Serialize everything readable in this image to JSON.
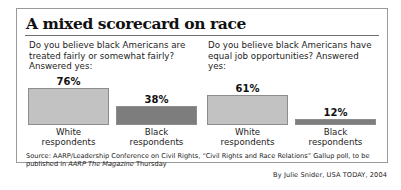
{
  "header": {
    "title": "A mixed scorecard on race"
  },
  "panels": [
    {
      "question": "Do you believe black Americans are treated fairly or somewhat fairly? Answered yes:",
      "bars": [
        {
          "value_label": "76%",
          "value": 76,
          "label_line1": "White",
          "label_line2": "respondents",
          "color": "#c2c2c2"
        },
        {
          "value_label": "38%",
          "value": 38,
          "label_line1": "Black",
          "label_line2": "respondents",
          "color": "#7d7d7d"
        }
      ]
    },
    {
      "question": "Do you believe black Americans have equal job opportunities? Answered yes:",
      "bars": [
        {
          "value_label": "61%",
          "value": 61,
          "label_line1": "White",
          "label_line2": "respondents",
          "color": "#c2c2c2"
        },
        {
          "value_label": "12%",
          "value": 12,
          "label_line1": "Black",
          "label_line2": "respondents",
          "color": "#7d7d7d"
        }
      ]
    }
  ],
  "source": {
    "part1": "Source: AARP/Leadership Conference on Civil Rights, “Civil Rights and Race Relations” Gallup poll, to be published in ",
    "italic": "AARP The Magazine",
    "part2": " Thursday"
  },
  "byline": "By Julie Snider, USA TODAY, 2004",
  "chart_data": {
    "type": "bar",
    "title": "A mixed scorecard on race",
    "xlabel": "",
    "ylabel": "Percent answering yes",
    "ylim": [
      0,
      100
    ],
    "grid": false,
    "legend": "none",
    "charts": [
      {
        "subtitle": "Do you believe black Americans are treated fairly or somewhat fairly? Answered yes:",
        "categories": [
          "White respondents",
          "Black respondents"
        ],
        "values": [
          76,
          38
        ],
        "value_labels": [
          "76%",
          "38%"
        ]
      },
      {
        "subtitle": "Do you believe black Americans have equal job opportunities? Answered yes:",
        "categories": [
          "White respondents",
          "Black respondents"
        ],
        "values": [
          61,
          12
        ],
        "value_labels": [
          "61%",
          "12%"
        ]
      }
    ],
    "source": "Source: AARP/Leadership Conference on Civil Rights, “Civil Rights and Race Relations” Gallup poll, to be published in AARP The Magazine Thursday",
    "credit": "By Julie Snider, USA TODAY, 2004"
  }
}
